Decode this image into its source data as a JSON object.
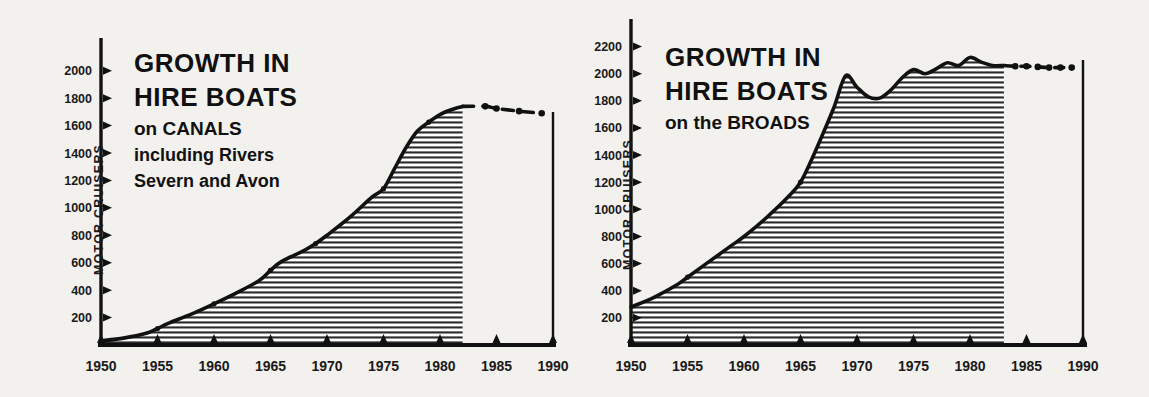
{
  "meta": {
    "background_color": "#f3f1ee",
    "ink_color": "#111111"
  },
  "chart_data": [
    {
      "id": "canals",
      "type": "area",
      "title": "GROWTH IN HIRE BOATS on CANALS including Rivers Severn and Avon",
      "title_lines": [
        "GROWTH IN",
        "HIRE BOATS",
        "on CANALS",
        "including Rivers",
        "Severn and Avon"
      ],
      "xlabel": "",
      "ylabel": "MOTOR CRUISERS",
      "xlim": [
        1950,
        1990
      ],
      "ylim": [
        0,
        2100
      ],
      "xticks": [
        1950,
        1955,
        1960,
        1965,
        1970,
        1975,
        1980,
        1985,
        1990
      ],
      "yticks": [
        200,
        400,
        600,
        800,
        1000,
        1200,
        1400,
        1600,
        1800,
        2000
      ],
      "grid": false,
      "legend": "none",
      "fill": "horizontal-hatch",
      "series": [
        {
          "name": "Hire boats on canals (actual)",
          "style": "solid",
          "x": [
            1950,
            1952,
            1954,
            1955,
            1956,
            1958,
            1960,
            1962,
            1964,
            1965,
            1966,
            1968,
            1969,
            1970,
            1972,
            1974,
            1975,
            1976,
            1977,
            1978,
            1979,
            1980,
            1981,
            1982
          ],
          "y": [
            30,
            50,
            85,
            120,
            160,
            225,
            300,
            380,
            470,
            545,
            610,
            690,
            740,
            800,
            930,
            1080,
            1140,
            1290,
            1440,
            1560,
            1625,
            1680,
            1715,
            1740
          ]
        },
        {
          "name": "Hire boats on canals (projected)",
          "style": "dashed",
          "x": [
            1982,
            1984,
            1985,
            1987,
            1989
          ],
          "y": [
            1740,
            1740,
            1725,
            1705,
            1690
          ]
        }
      ],
      "annotations": []
    },
    {
      "id": "broads",
      "type": "area",
      "title": "GROWTH IN HIRE BOATS on the BROADS",
      "title_lines": [
        "GROWTH IN",
        "HIRE BOATS",
        "on the BROADS"
      ],
      "xlabel": "",
      "ylabel": "MOTOR CRUISERS",
      "xlim": [
        1950,
        1990
      ],
      "ylim": [
        0,
        2300
      ],
      "xticks": [
        1950,
        1955,
        1960,
        1965,
        1970,
        1975,
        1980,
        1985,
        1990
      ],
      "yticks": [
        200,
        400,
        600,
        800,
        1000,
        1200,
        1400,
        1600,
        1800,
        2000,
        2200
      ],
      "grid": false,
      "legend": "none",
      "fill": "horizontal-hatch",
      "series": [
        {
          "name": "Hire boats on the Broads (actual)",
          "style": "solid",
          "x": [
            1950,
            1952,
            1954,
            1955,
            1957,
            1959,
            1960,
            1962,
            1964,
            1965,
            1966,
            1967,
            1968,
            1969,
            1970,
            1971,
            1972,
            1973,
            1974,
            1975,
            1976,
            1977,
            1978,
            1979,
            1980,
            1981,
            1982,
            1983
          ],
          "y": [
            280,
            350,
            440,
            500,
            620,
            740,
            800,
            940,
            1100,
            1200,
            1370,
            1560,
            1760,
            1985,
            1900,
            1830,
            1820,
            1880,
            1970,
            2030,
            2000,
            2035,
            2080,
            2060,
            2120,
            2085,
            2060,
            2060
          ]
        },
        {
          "name": "Hire boats on the Broads (projected)",
          "style": "dashed",
          "x": [
            1983,
            1984,
            1985,
            1986,
            1987,
            1988,
            1989
          ],
          "y": [
            2060,
            2055,
            2055,
            2050,
            2045,
            2045,
            2045
          ]
        }
      ],
      "annotations": []
    }
  ]
}
